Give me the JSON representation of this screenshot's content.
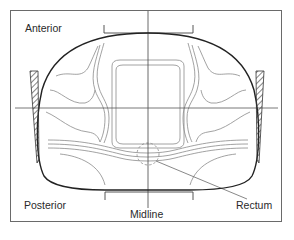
{
  "figure": {
    "type": "dose-distribution cross-section diagram",
    "labels": {
      "anterior": "Anterior",
      "posterior": "Posterior",
      "midline": "Midline",
      "rectum": "Rectum"
    },
    "elements": {
      "body_outline": "body-contour",
      "isodose_lines": "isodose-contours",
      "wedges": [
        "left-wedge",
        "right-wedge"
      ],
      "rectum_marker": "dashed-circle",
      "axes": [
        "vertical-midline",
        "horizontal-axis"
      ]
    },
    "colors": {
      "outline": "#222222",
      "contour": "#8a8a8a",
      "frame": "#6a6a6a",
      "text": "#2a2a2a"
    }
  }
}
